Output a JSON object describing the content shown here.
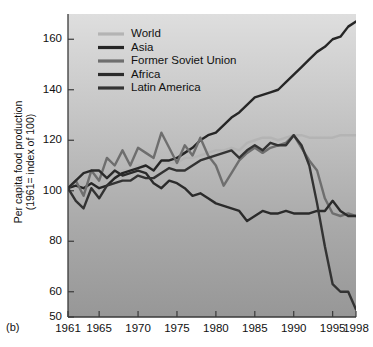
{
  "panel": {
    "label": "(b)"
  },
  "axes": {
    "ylabel": "Per capita food production\n(1961= index of 100)",
    "xlabel": "",
    "yticks": [
      50,
      60,
      80,
      100,
      120,
      140,
      160
    ],
    "xticks": [
      1961,
      1965,
      1970,
      1975,
      1980,
      1985,
      1990,
      1995,
      1998
    ],
    "ylim": [
      50,
      170
    ],
    "xlim": [
      1961,
      1998
    ]
  },
  "colors": {
    "world": "#b4b4b4",
    "asia": "#262626",
    "former_soviet_union": "#6e6e6e",
    "africa": "#2b2b2b",
    "latin_america": "#333333",
    "plot_bg_top": "#dcdcdc",
    "plot_bg_bottom": "#9a9a9a",
    "axis": "#3a3a3a",
    "text": "#111111"
  },
  "legend": {
    "position": "top-left",
    "entries": [
      {
        "label": "World",
        "color": "#b4b4b4"
      },
      {
        "label": "Asia",
        "color": "#262626"
      },
      {
        "label": "Former Soviet Union",
        "color": "#6e6e6e"
      },
      {
        "label": "Africa",
        "color": "#2b2b2b"
      },
      {
        "label": "Latin America",
        "color": "#333333"
      }
    ]
  },
  "chart_data": {
    "type": "line",
    "title": "",
    "subtitle": "",
    "xlabel": "",
    "ylabel": "Per capita food production (1961= index of 100)",
    "xlim": [
      1961,
      1998
    ],
    "ylim": [
      50,
      170
    ],
    "yticks": [
      50,
      60,
      80,
      100,
      120,
      140,
      160
    ],
    "xticks": [
      1961,
      1965,
      1970,
      1975,
      1980,
      1985,
      1990,
      1995,
      1998
    ],
    "grid": false,
    "legend_position": "top-left",
    "x": [
      1961,
      1962,
      1963,
      1964,
      1965,
      1966,
      1967,
      1968,
      1969,
      1970,
      1971,
      1972,
      1973,
      1974,
      1975,
      1976,
      1977,
      1978,
      1979,
      1980,
      1981,
      1982,
      1983,
      1984,
      1985,
      1986,
      1987,
      1988,
      1989,
      1990,
      1991,
      1992,
      1993,
      1994,
      1995,
      1996,
      1997,
      1998
    ],
    "series": [
      {
        "name": "World",
        "color": "#b4b4b4",
        "values": [
          101,
          102,
          103,
          104,
          105,
          106,
          107,
          108,
          108,
          110,
          110,
          109,
          111,
          111,
          111,
          113,
          113,
          114,
          115,
          116,
          116,
          117,
          116,
          119,
          120,
          121,
          121,
          120,
          121,
          122,
          122,
          121,
          121,
          121,
          121,
          122,
          122,
          122
        ]
      },
      {
        "name": "Asia",
        "color": "#262626",
        "values": [
          101,
          102,
          101,
          103,
          101,
          102,
          105,
          107,
          108,
          109,
          110,
          108,
          112,
          112,
          113,
          115,
          117,
          120,
          122,
          123,
          126,
          129,
          131,
          134,
          137,
          138,
          139,
          140,
          143,
          146,
          149,
          152,
          155,
          157,
          160,
          161,
          165,
          167
        ]
      },
      {
        "name": "Former Soviet Union",
        "color": "#6e6e6e",
        "values": [
          101,
          104,
          98,
          108,
          104,
          113,
          110,
          116,
          110,
          117,
          115,
          113,
          123,
          117,
          111,
          118,
          114,
          121,
          114,
          110,
          102,
          107,
          112,
          115,
          117,
          115,
          117,
          118,
          119,
          122,
          117,
          112,
          108,
          97,
          91,
          90,
          91,
          90
        ]
      },
      {
        "name": "Africa",
        "color": "#2b2b2b",
        "values": [
          101,
          104,
          107,
          108,
          108,
          105,
          108,
          106,
          107,
          108,
          107,
          103,
          101,
          104,
          103,
          101,
          98,
          99,
          97,
          95,
          94,
          93,
          92,
          88,
          90,
          92,
          91,
          91,
          92,
          91,
          91,
          91,
          92,
          92,
          96,
          92,
          90,
          90
        ]
      },
      {
        "name": "Latin America",
        "color": "#333333",
        "values": [
          101,
          96,
          93,
          101,
          97,
          102,
          103,
          104,
          104,
          106,
          105,
          105,
          107,
          109,
          108,
          108,
          110,
          112,
          113,
          114,
          115,
          116,
          113,
          116,
          118,
          116,
          119,
          118,
          118,
          122,
          118,
          110,
          95,
          78,
          63,
          60,
          60,
          53
        ]
      }
    ],
    "annotations": [
      {
        "text": "(b)",
        "position": "bottom-left-outside"
      }
    ]
  }
}
